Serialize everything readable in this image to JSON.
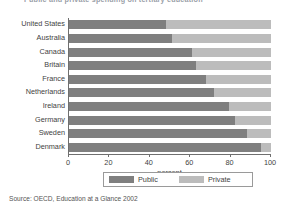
{
  "chart_data": {
    "type": "bar",
    "orientation": "horizontal",
    "stacked": true,
    "stacked_percent": true,
    "title": "Public and private spending on tertiary education",
    "xlabel": "percent",
    "ylabel": "",
    "xlim": [
      0,
      100
    ],
    "xticks": [
      0,
      20,
      40,
      60,
      80,
      100
    ],
    "grid": false,
    "legend_position": "bottom-center",
    "categories": [
      "United States",
      "Australia",
      "Canada",
      "Britain",
      "France",
      "Netherlands",
      "Ireland",
      "Germany",
      "Sweden",
      "Denmark"
    ],
    "series": [
      {
        "name": "Public",
        "color": "#7f7f7f",
        "values": [
          48,
          51,
          61,
          63,
          68,
          72,
          79,
          82,
          88,
          95
        ]
      },
      {
        "name": "Private",
        "color": "#bcbcbc",
        "values": [
          52,
          49,
          39,
          37,
          32,
          28,
          21,
          18,
          12,
          5
        ]
      }
    ],
    "source": "Source: OECD, Education at a Glance 2002"
  },
  "axis": {
    "tick_labels": [
      "0",
      "20",
      "40",
      "60",
      "80",
      "100"
    ],
    "x_title": "percent"
  },
  "legend": {
    "items": [
      {
        "label": "Public",
        "color": "#7f7f7f"
      },
      {
        "label": "Private",
        "color": "#bcbcbc"
      }
    ]
  },
  "footer": {
    "source": "Source: OECD, Education at a Glance 2002"
  }
}
